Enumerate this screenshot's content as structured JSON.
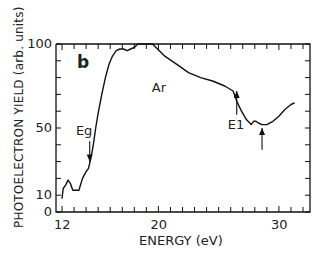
{
  "chart_data": {
    "type": "line",
    "title": "",
    "panel_label": "b",
    "xlabel": "ENERGY (eV)",
    "ylabel": "PHOTOELECTRON YIELD (arb. units)",
    "xlim": [
      11.5,
      32.6
    ],
    "ylim": [
      0,
      100
    ],
    "x_ticks": [
      12,
      20,
      30
    ],
    "y_ticks": [
      0,
      10,
      50,
      100
    ],
    "grid": false,
    "legend": null,
    "series": [
      {
        "name": "Ar",
        "x": [
          12.0,
          12.1,
          12.3,
          12.5,
          12.7,
          12.9,
          13.1,
          13.4,
          13.7,
          14.0,
          14.2,
          14.4,
          14.6,
          14.8,
          15.0,
          15.3,
          15.6,
          15.9,
          16.2,
          16.5,
          16.8,
          17.1,
          17.4,
          17.7,
          18.0,
          18.3,
          18.6,
          18.9,
          19.2,
          19.5,
          19.8,
          20.5,
          21.5,
          22.5,
          23.5,
          24.5,
          25.5,
          26.2,
          26.5,
          26.9,
          27.3,
          27.7,
          27.9,
          28.1,
          28.3,
          28.6,
          29.0,
          29.5,
          30.0,
          30.5,
          31.0,
          31.3
        ],
        "y": [
          8,
          14,
          16,
          19,
          17,
          13,
          13,
          13,
          20,
          24,
          26,
          32,
          40,
          50,
          59,
          70,
          80,
          88,
          93,
          96,
          97,
          97,
          96,
          97,
          98,
          100,
          100,
          100,
          100,
          100,
          98,
          93,
          88,
          83,
          80,
          78,
          75,
          72,
          66,
          60,
          55,
          52,
          54,
          54,
          53,
          52,
          52,
          54,
          57,
          61,
          64,
          65
        ]
      }
    ],
    "annotations": [
      {
        "text": "Ar",
        "x": 20.2,
        "y": 74
      },
      {
        "text": "Eg",
        "x": 13.9,
        "y": 48,
        "arrow_to": [
          14.3,
          30
        ]
      },
      {
        "text": "E1",
        "x": 26.5,
        "y": 52,
        "arrow_to": [
          26.5,
          72
        ]
      },
      {
        "text": "",
        "x": 28.6,
        "y": 37,
        "arrow_to": [
          28.6,
          50
        ]
      }
    ]
  }
}
